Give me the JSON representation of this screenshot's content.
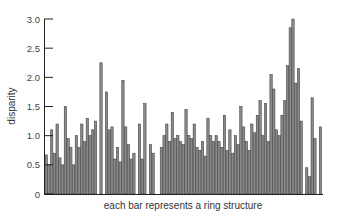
{
  "chart_data": {
    "type": "bar",
    "title": "",
    "xlabel": "each bar represents a ring structure",
    "ylabel": "disparity",
    "ylim": [
      0,
      3.0
    ],
    "yticks": [
      0,
      0.5,
      1.0,
      1.5,
      2.0,
      2.5,
      3.0
    ],
    "ytick_labels": [
      "0",
      "0.5",
      "1.0",
      "1.5",
      "2.0",
      "2.5",
      "3.0"
    ],
    "grid": false,
    "legend": null,
    "bar_color": "#8a8a8a",
    "bar_edge_color": "#333333",
    "values": [
      0.67,
      0.5,
      1.1,
      0.7,
      1.2,
      0.62,
      0.5,
      1.5,
      0.95,
      0.8,
      0.5,
      1.0,
      0.8,
      1.2,
      0.9,
      1.3,
      1.0,
      1.1,
      1.25,
      null,
      2.25,
      null,
      1.75,
      1.1,
      1.15,
      0.6,
      0.8,
      0.55,
      1.95,
      1.15,
      0.85,
      0.6,
      0.7,
      null,
      1.2,
      0.6,
      1.55,
      null,
      0.85,
      0.7,
      null,
      null,
      0.8,
      1.0,
      1.2,
      0.9,
      1.4,
      0.95,
      1.0,
      0.9,
      0.85,
      1.45,
      1.0,
      0.95,
      1.2,
      0.8,
      0.75,
      0.9,
      0.65,
      1.3,
      1.0,
      0.9,
      1.0,
      0.9,
      0.8,
      1.35,
      0.75,
      1.1,
      0.7,
      1.0,
      0.85,
      1.5,
      1.15,
      0.9,
      0.75,
      1.2,
      1.05,
      1.35,
      1.6,
      1.0,
      1.55,
      0.9,
      2.05,
      1.8,
      1.1,
      1.0,
      1.35,
      1.6,
      2.2,
      2.85,
      3.0,
      1.9,
      2.15,
      1.25,
      null,
      0.45,
      0.3,
      1.65,
      0.95,
      null,
      1.15
    ]
  },
  "axes": {
    "x_label": "each bar represents a ring structure",
    "y_label": "disparity"
  }
}
